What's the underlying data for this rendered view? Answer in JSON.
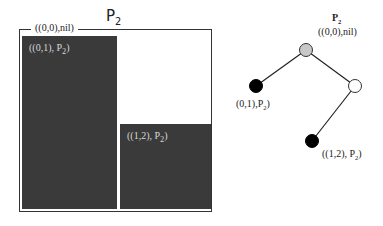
{
  "partition": {
    "title_main": "P",
    "title_sub": "2",
    "frame_label": "((0,0),nil)",
    "blocks": [
      {
        "label_pre": "((0,1), P",
        "label_sub": "2",
        "label_post": ")"
      },
      {
        "label_pre": "((1,2), P",
        "label_sub": "2",
        "label_post": ")"
      }
    ]
  },
  "tree": {
    "root": {
      "title_main": "P",
      "title_sub": "2",
      "label": "((0,0),nil)",
      "fill": "#c8c8c8"
    },
    "left_leaf": {
      "label_pre": "(0,1),P",
      "label_sub": "2",
      "label_post": ")",
      "fill": "#000000"
    },
    "right_node": {
      "fill": "#ffffff"
    },
    "bottom_leaf": {
      "label_pre": "((1,2), P",
      "label_sub": "2",
      "label_post": ")",
      "fill": "#000000"
    }
  }
}
